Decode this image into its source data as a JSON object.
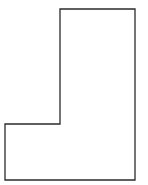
{
  "diagram": {
    "type": "polygon-outline",
    "shape": "L-shape",
    "stroke_color": "#2b2b2b",
    "fill_color": "#ffffff",
    "stroke_width": 1.3,
    "points": [
      [
        60,
        9
      ],
      [
        135,
        9
      ],
      [
        135,
        180
      ],
      [
        5,
        180
      ],
      [
        5,
        124
      ],
      [
        60,
        124
      ]
    ]
  }
}
